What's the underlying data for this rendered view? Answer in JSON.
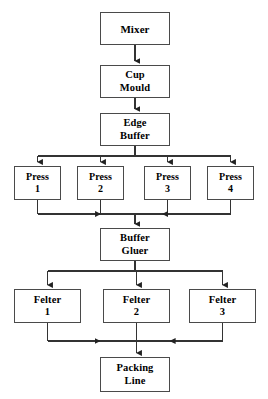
{
  "diagram": {
    "type": "process-flowchart",
    "background_color": "#ffffff",
    "box_fill_color": "#ffffff",
    "box_border_color": "#4a4a4a",
    "line_color": "#333333",
    "text_color": "#000000",
    "nodes": [
      {
        "id": "mixer",
        "label": "Mixer",
        "stage": 1,
        "x": 100,
        "y": 12,
        "w": 70,
        "h": 33
      },
      {
        "id": "cup-mould",
        "label": "Cup\nMould",
        "stage": 2,
        "x": 100,
        "y": 65,
        "w": 70,
        "h": 33
      },
      {
        "id": "edge-buffer",
        "label": "Edge\nBuffer",
        "stage": 3,
        "x": 100,
        "y": 113,
        "w": 70,
        "h": 33
      },
      {
        "id": "press-1",
        "label": "Press\n1",
        "stage": 4,
        "x": 14,
        "y": 166,
        "w": 47,
        "h": 34
      },
      {
        "id": "press-2",
        "label": "Press\n2",
        "stage": 4,
        "x": 77,
        "y": 166,
        "w": 47,
        "h": 34
      },
      {
        "id": "press-3",
        "label": "Press\n3",
        "stage": 4,
        "x": 144,
        "y": 166,
        "w": 47,
        "h": 34
      },
      {
        "id": "press-4",
        "label": "Press\n4",
        "stage": 4,
        "x": 207,
        "y": 166,
        "w": 47,
        "h": 34
      },
      {
        "id": "buffer-gluer",
        "label": "Buffer\nGluer",
        "stage": 5,
        "x": 100,
        "y": 228,
        "w": 70,
        "h": 33
      },
      {
        "id": "felter-1",
        "label": "Felter\n1",
        "stage": 6,
        "x": 14,
        "y": 289,
        "w": 67,
        "h": 34
      },
      {
        "id": "felter-2",
        "label": "Felter\n2",
        "stage": 6,
        "x": 103,
        "y": 289,
        "w": 67,
        "h": 34
      },
      {
        "id": "felter-3",
        "label": "Felter\n3",
        "stage": 6,
        "x": 189,
        "y": 289,
        "w": 67,
        "h": 34
      },
      {
        "id": "packing-line",
        "label": "Packing\nLine",
        "stage": 7,
        "x": 100,
        "y": 357,
        "w": 70,
        "h": 35
      }
    ],
    "edges": [
      {
        "from": "mixer",
        "to": "cup-mould",
        "kind": "straight"
      },
      {
        "from": "cup-mould",
        "to": "edge-buffer",
        "kind": "straight"
      },
      {
        "from": "edge-buffer",
        "to": "press-1",
        "kind": "fan-out"
      },
      {
        "from": "edge-buffer",
        "to": "press-2",
        "kind": "fan-out"
      },
      {
        "from": "edge-buffer",
        "to": "press-3",
        "kind": "fan-out"
      },
      {
        "from": "edge-buffer",
        "to": "press-4",
        "kind": "fan-out"
      },
      {
        "from": "press-1",
        "to": "buffer-gluer",
        "kind": "fan-in"
      },
      {
        "from": "press-2",
        "to": "buffer-gluer",
        "kind": "fan-in"
      },
      {
        "from": "press-3",
        "to": "buffer-gluer",
        "kind": "fan-in"
      },
      {
        "from": "press-4",
        "to": "buffer-gluer",
        "kind": "fan-in"
      },
      {
        "from": "buffer-gluer",
        "to": "felter-1",
        "kind": "fan-out"
      },
      {
        "from": "buffer-gluer",
        "to": "felter-2",
        "kind": "fan-out"
      },
      {
        "from": "buffer-gluer",
        "to": "felter-3",
        "kind": "fan-out"
      },
      {
        "from": "felter-1",
        "to": "packing-line",
        "kind": "fan-in"
      },
      {
        "from": "felter-2",
        "to": "packing-line",
        "kind": "fan-in"
      },
      {
        "from": "felter-3",
        "to": "packing-line",
        "kind": "fan-in"
      }
    ]
  }
}
